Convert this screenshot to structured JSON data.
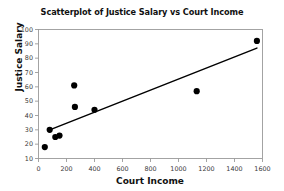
{
  "chart_data": {
    "type": "scatter",
    "title": "Scatterplot of Justice Salary vs Court Income",
    "xlabel": "Court Income",
    "ylabel": "Justice Salary",
    "xlim": [
      0,
      1600
    ],
    "ylim": [
      10,
      100
    ],
    "xticks": [
      0,
      200,
      400,
      600,
      800,
      1000,
      1200,
      1400,
      1600
    ],
    "yticks": [
      10,
      20,
      30,
      40,
      50,
      60,
      70,
      80,
      90,
      100
    ],
    "grid": false,
    "legend": null,
    "marker_color": "#000000",
    "marker_shape": "circle",
    "points": [
      {
        "x": 45,
        "y": 18
      },
      {
        "x": 80,
        "y": 30
      },
      {
        "x": 120,
        "y": 25
      },
      {
        "x": 150,
        "y": 26
      },
      {
        "x": 255,
        "y": 61
      },
      {
        "x": 260,
        "y": 46
      },
      {
        "x": 400,
        "y": 44
      },
      {
        "x": 1130,
        "y": 57
      },
      {
        "x": 1560,
        "y": 92
      }
    ],
    "trendline": {
      "type": "line",
      "color": "#000000",
      "x_start": 80,
      "y_start": 30,
      "x_end": 1560,
      "y_end": 87
    }
  },
  "axis": {
    "x_tick_labels": [
      "0",
      "200",
      "400",
      "600",
      "800",
      "1000",
      "1200",
      "1400",
      "1600"
    ],
    "y_tick_labels": [
      "10",
      "20",
      "30",
      "40",
      "50",
      "60",
      "70",
      "80",
      "90",
      "100"
    ]
  },
  "colors": {
    "frame": "#9a9a9a",
    "marker": "#000000",
    "trendline": "#000000",
    "text": "#111111",
    "background": "#ffffff"
  }
}
